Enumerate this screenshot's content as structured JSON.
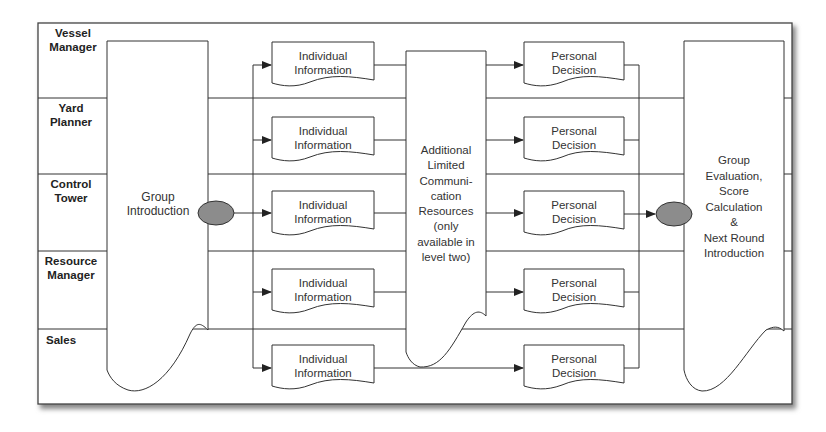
{
  "diagram": {
    "type": "swimlane-flowchart",
    "lanes": [
      {
        "label": "Vessel Manager"
      },
      {
        "label": "Yard Planner"
      },
      {
        "label": "Control Tower"
      },
      {
        "label": "Resource Manager"
      },
      {
        "label": "Sales"
      }
    ],
    "lane_labels": {
      "l0a": "Vessel",
      "l0b": "Manager",
      "l1a": "Yard",
      "l1b": "Planner",
      "l2a": "Control",
      "l2b": "Tower",
      "l3a": "Resource",
      "l3b": "Manager",
      "l4a": "Sales"
    },
    "group_intro": {
      "line1": "Group",
      "line2": "Introduction"
    },
    "individual_info": {
      "line1": "Individual",
      "line2": "Information"
    },
    "communication": {
      "lines": [
        "Additional",
        "Limited",
        "Communi-",
        "cation",
        "Resources",
        "(only",
        "available in",
        "level two)"
      ]
    },
    "personal_decision": {
      "line1": "Personal",
      "line2": "Decision"
    },
    "group_eval": {
      "lines": [
        "Group",
        "Evaluation,",
        "Score",
        "Calculation",
        "&",
        "Next Round",
        "Introduction"
      ]
    },
    "colors": {
      "line": "#333333",
      "connector": "#8a8a8a",
      "shadow": "#9a9a9a"
    }
  }
}
